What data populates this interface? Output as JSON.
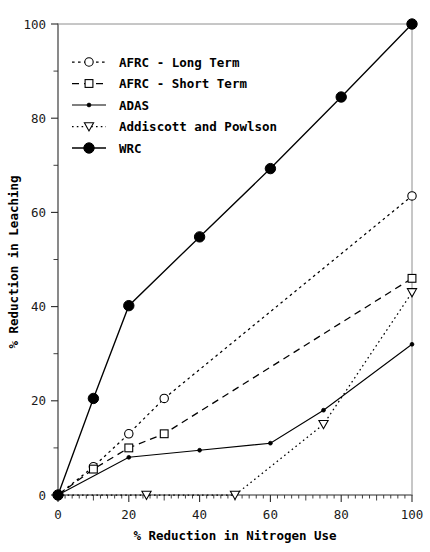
{
  "chart_data": {
    "type": "line",
    "title": "",
    "xlabel": "% Reduction in Nitrogen Use",
    "ylabel": "% Reduction in Leaching",
    "xlim": [
      0,
      100
    ],
    "ylim": [
      0,
      100
    ],
    "xticks": [
      0,
      20,
      40,
      60,
      80,
      100
    ],
    "yticks": [
      0,
      20,
      40,
      60,
      80,
      100
    ],
    "xticklabels": [
      "0",
      "20",
      "40",
      "60",
      "80",
      "100"
    ],
    "yticklabels": [
      "0",
      "20",
      "40",
      "60",
      "80",
      "100"
    ],
    "grid": false,
    "legend_position": "upper left",
    "minor_ticks": true,
    "series": [
      {
        "name": "AFRC - Long Term",
        "marker": "circle-open",
        "linestyle": "dotted-dashed",
        "color": "#000000",
        "x": [
          0,
          10,
          20,
          30,
          100
        ],
        "y": [
          0,
          6,
          13,
          20.5,
          63.5
        ]
      },
      {
        "name": "AFRC - Short Term",
        "marker": "square-open",
        "linestyle": "dashed",
        "color": "#000000",
        "x": [
          0,
          10,
          20,
          30,
          100
        ],
        "y": [
          0,
          5.5,
          10,
          13,
          46
        ]
      },
      {
        "name": "ADAS",
        "marker": "dot-small",
        "linestyle": "solid",
        "color": "#000000",
        "x": [
          0,
          20,
          40,
          60,
          75,
          100
        ],
        "y": [
          0,
          8,
          9.5,
          11,
          18,
          32
        ]
      },
      {
        "name": "Addiscott and Powlson",
        "marker": "triangle-down-open",
        "linestyle": "dotted",
        "color": "#000000",
        "x": [
          0,
          25,
          50,
          75,
          100
        ],
        "y": [
          0,
          0,
          0,
          15,
          43
        ]
      },
      {
        "name": "WRC",
        "marker": "circle-filled",
        "linestyle": "solid",
        "color": "#000000",
        "x": [
          0,
          10,
          20,
          40,
          60,
          80,
          100
        ],
        "y": [
          0,
          20.5,
          40.2,
          54.8,
          69.3,
          84.5,
          100
        ]
      }
    ],
    "legend_entries": [
      "AFRC - Long Term",
      "AFRC - Short Term",
      "ADAS",
      "Addiscott and Powlson",
      "WRC"
    ]
  }
}
